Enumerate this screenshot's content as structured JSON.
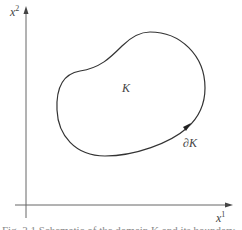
{
  "figure": {
    "type": "diagram",
    "axes": {
      "vertical_label_base": "x",
      "vertical_label_sup": "2",
      "horizontal_label_base": "x",
      "horizontal_label_sup": "1"
    },
    "region_label": "K",
    "boundary_label": "∂K",
    "caption_partial": "Fig. 3.1  Schematic of the domain K and its boundary"
  },
  "colors": {
    "stroke": "#333333",
    "axis": "#666666",
    "background": "#ffffff"
  }
}
